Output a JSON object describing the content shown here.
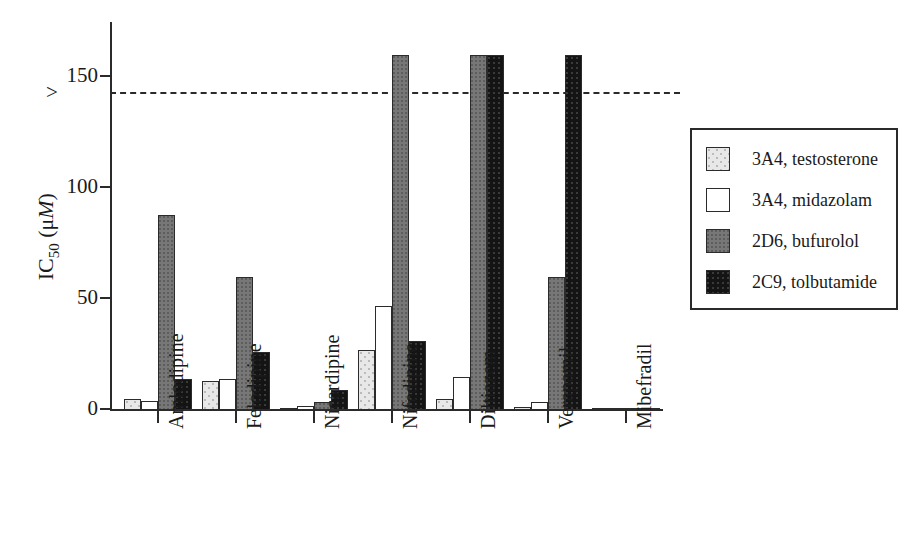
{
  "chart_data": {
    "type": "bar",
    "title": "",
    "xlabel": "",
    "ylabel": "IC50 (μM)",
    "ylabel_parts": {
      "prefix": "IC",
      "sub": "50",
      "unit_open": " (μ",
      "unit_italic": "M",
      "unit_close": ")"
    },
    "ylim": [
      0,
      175
    ],
    "yticks": [
      0,
      50,
      100,
      150
    ],
    "ytick_labels": [
      "0",
      "50",
      "100",
      "150"
    ],
    "ytick_prefix_150": ">",
    "reference_line": {
      "value": 150,
      "style": "dashed",
      "label": "> 150"
    },
    "grid": false,
    "legend_position": "right",
    "categories": [
      "Amlodipine",
      "Felodipine",
      "Nicardipine",
      "Nifedipine",
      "Diltiazem",
      "Verapamil",
      "Mibefradil"
    ],
    "series": [
      {
        "name": "3A4, testosterone",
        "swatch": "sw-testosterone",
        "color": "#e8e8e8",
        "values": [
          5,
          13,
          1,
          27,
          5,
          1.5,
          0.5
        ]
      },
      {
        "name": "3A4, midazolam",
        "swatch": "sw-midazolam",
        "color": "#ffffff",
        "values": [
          4,
          14,
          2,
          47,
          15,
          3.5,
          0.5
        ]
      },
      {
        "name": "2D6, bufurolol",
        "swatch": "sw-bufurolol",
        "color": "#777777",
        "values": [
          88,
          60,
          3.5,
          160,
          160,
          60,
          0.5
        ]
      },
      {
        "name": "2C9, tolbutamide",
        "swatch": "sw-tolbutamide",
        "color": "#141414",
        "values": [
          14,
          26,
          9,
          31,
          160,
          160,
          0.5
        ]
      }
    ]
  },
  "legend": {
    "items": [
      {
        "label": "3A4, testosterone",
        "swatch": "sw-testosterone"
      },
      {
        "label": "3A4, midazolam",
        "swatch": "sw-midazolam"
      },
      {
        "label": "2D6, bufurolol",
        "swatch": "sw-bufurolol"
      },
      {
        "label": "2C9, tolbutamide",
        "swatch": "sw-tolbutamide"
      }
    ]
  }
}
